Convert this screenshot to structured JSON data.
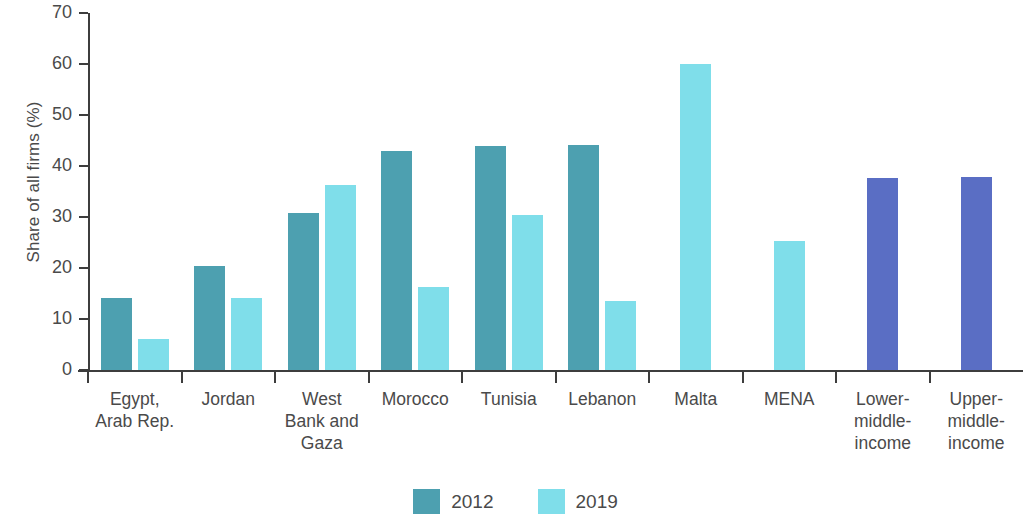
{
  "chart_data": {
    "type": "bar",
    "title": "",
    "xlabel": "",
    "ylabel": "Share of all firms (%)",
    "ylim": [
      0,
      70
    ],
    "ytick_labels": [
      "0",
      "10",
      "20",
      "30",
      "40",
      "50",
      "60",
      "70"
    ],
    "ytick_values": [
      0,
      10,
      20,
      30,
      40,
      50,
      60,
      70
    ],
    "grid": false,
    "legend_position": "bottom-center",
    "categories": [
      "Egypt, Arab Rep.",
      "Jordan",
      "West Bank and Gaza",
      "Morocco",
      "Tunisia",
      "Lebanon",
      "Malta",
      "MENA",
      "Lower-middle-income",
      "Upper-middle-income"
    ],
    "category_label_lines": [
      [
        "Egypt,",
        "Arab Rep."
      ],
      [
        "Jordan"
      ],
      [
        "West",
        "Bank and",
        "Gaza"
      ],
      [
        "Morocco"
      ],
      [
        "Tunisia"
      ],
      [
        "Lebanon"
      ],
      [
        "Malta"
      ],
      [
        "MENA"
      ],
      [
        "Lower-",
        "middle-",
        "income"
      ],
      [
        "Upper-",
        "middle-",
        "income"
      ]
    ],
    "series": [
      {
        "name": "2012",
        "color": "#4da0b0",
        "values": [
          14.2,
          20.3,
          30.8,
          43.0,
          44.0,
          44.1,
          null,
          null,
          null,
          null
        ]
      },
      {
        "name": "2019",
        "color": "#7fdeea",
        "values": [
          6.1,
          14.2,
          36.2,
          16.2,
          30.3,
          13.6,
          60.0,
          25.2,
          null,
          null
        ]
      },
      {
        "name": "benchmark",
        "color": "#5a6ec4",
        "values": [
          null,
          null,
          null,
          null,
          null,
          null,
          null,
          null,
          37.7,
          37.9
        ]
      }
    ]
  },
  "legend": {
    "items": [
      {
        "label": "2012",
        "color": "#4da0b0"
      },
      {
        "label": "2019",
        "color": "#7fdeea"
      }
    ]
  },
  "colors": {
    "series_2012": "#4da0b0",
    "series_2019": "#7fdeea",
    "benchmark": "#5a6ec4",
    "axis": "#3d3d3d",
    "text": "#4a4a4a",
    "background": "#ffffff"
  }
}
